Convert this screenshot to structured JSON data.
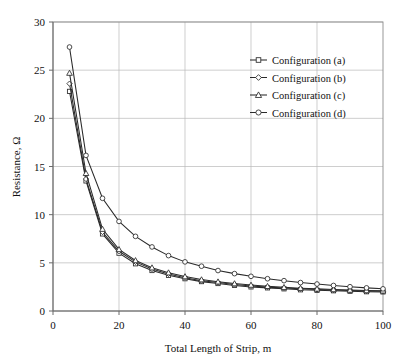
{
  "chart_data": {
    "type": "line",
    "title": "",
    "xlabel": "Total Length of Strip, m",
    "ylabel": "Resistance, Ω",
    "xlim": [
      0,
      100
    ],
    "ylim": [
      0,
      30
    ],
    "xticks": [
      0,
      20,
      40,
      60,
      80,
      100
    ],
    "yticks": [
      0,
      5,
      10,
      15,
      20,
      25,
      30
    ],
    "xtick_labels": [
      "0",
      "20",
      "40",
      "60",
      "80",
      "100"
    ],
    "ytick_labels": [
      "0",
      "5",
      "10",
      "15",
      "20",
      "25",
      "30"
    ],
    "grid": true,
    "legend_position": "upper right",
    "x": [
      5,
      10,
      15,
      20,
      25,
      30,
      35,
      40,
      45,
      50,
      55,
      60,
      65,
      70,
      75,
      80,
      85,
      90,
      95,
      100
    ],
    "series": [
      {
        "name": "Configuration (a)",
        "marker": "square",
        "color": "#2a2a2a",
        "values": [
          22.8,
          13.5,
          8.0,
          6.0,
          4.9,
          4.2,
          3.7,
          3.35,
          3.05,
          2.85,
          2.65,
          2.5,
          2.4,
          2.3,
          2.2,
          2.15,
          2.1,
          2.05,
          2.0,
          1.98
        ]
      },
      {
        "name": "Configuration (b)",
        "marker": "diamond",
        "color": "#2a2a2a",
        "values": [
          23.6,
          13.7,
          8.2,
          6.2,
          5.1,
          4.35,
          3.85,
          3.45,
          3.15,
          2.95,
          2.75,
          2.6,
          2.48,
          2.38,
          2.3,
          2.24,
          2.18,
          2.12,
          2.08,
          2.05
        ]
      },
      {
        "name": "Configuration (c)",
        "marker": "triangle",
        "color": "#2a2a2a",
        "values": [
          24.7,
          14.3,
          8.5,
          6.4,
          5.25,
          4.5,
          3.98,
          3.58,
          3.26,
          3.04,
          2.85,
          2.7,
          2.57,
          2.46,
          2.37,
          2.3,
          2.24,
          2.18,
          2.13,
          2.1
        ]
      },
      {
        "name": "Configuration (d)",
        "marker": "circle",
        "color": "#2a2a2a",
        "values": [
          27.4,
          16.15,
          11.7,
          9.3,
          7.75,
          6.65,
          5.75,
          5.1,
          4.65,
          4.2,
          3.88,
          3.6,
          3.35,
          3.15,
          2.95,
          2.8,
          2.65,
          2.52,
          2.4,
          2.3
        ]
      }
    ]
  },
  "axes": {
    "x_title": "Total Length of Strip, m",
    "y_title": "Resistance, Ω"
  },
  "legend": {
    "items": [
      {
        "label": "Configuration (a)"
      },
      {
        "label": "Configuration (b)"
      },
      {
        "label": "Configuration (c)"
      },
      {
        "label": "Configuration (d)"
      }
    ]
  }
}
